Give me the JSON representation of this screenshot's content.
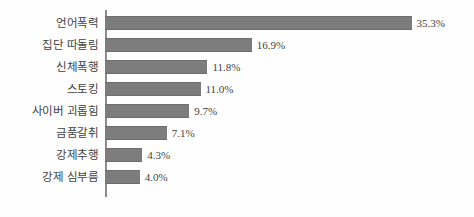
{
  "chart_data": {
    "type": "bar",
    "orientation": "horizontal",
    "title": "",
    "subtitle": "",
    "xlabel": "",
    "ylabel": "",
    "grid": false,
    "legend": null,
    "xlim": [
      0,
      38
    ],
    "axis_line": "vertical-left",
    "categories": [
      "언어폭력",
      "집단 따돌림",
      "신체폭행",
      "스토킹",
      "사이버 괴롭힘",
      "금품갈취",
      "강제추행",
      "강제 심부름"
    ],
    "values": [
      35.3,
      16.9,
      11.8,
      11.0,
      9.7,
      7.1,
      4.3,
      4.0
    ],
    "value_labels": [
      "35.3%",
      "16.9%",
      "11.8%",
      "11.0%",
      "9.7%",
      "7.1%",
      "4.3%",
      "4.0%"
    ],
    "bars": [
      {
        "category": "언어폭력",
        "value": 35.3,
        "label": "35.3%"
      },
      {
        "category": "집단 따돌림",
        "value": 16.9,
        "label": "16.9%"
      },
      {
        "category": "신체폭행",
        "value": 11.8,
        "label": "11.8%"
      },
      {
        "category": "스토킹",
        "value": 11.0,
        "label": "11.0%"
      },
      {
        "category": "사이버 괴롭힘",
        "value": 9.7,
        "label": "9.7%"
      },
      {
        "category": "금품갈취",
        "value": 7.1,
        "label": "7.1%"
      },
      {
        "category": "강제추행",
        "value": 4.3,
        "label": "4.3%"
      },
      {
        "category": "강제 심부름",
        "value": 4.0,
        "label": "4.0%"
      }
    ],
    "colors": {
      "bar_fill": "#7d7d7d",
      "bar_stroke": "#6e6e6e",
      "axis_line": "#8c8c8c",
      "text": "#3f3f3f",
      "background": "#ffffff"
    }
  }
}
